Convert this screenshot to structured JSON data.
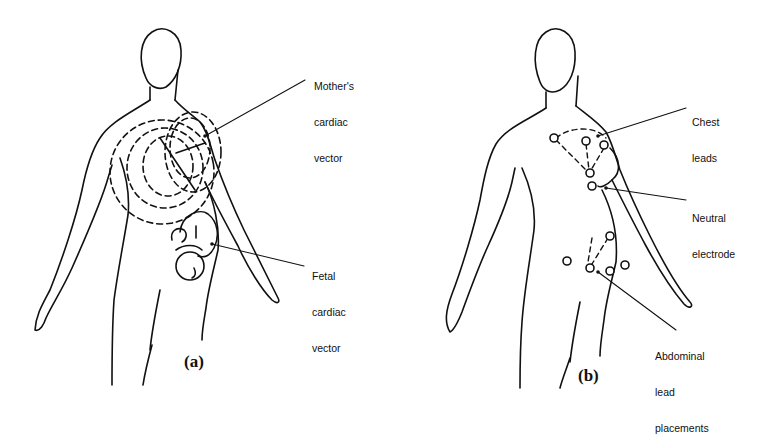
{
  "colors": {
    "ink": "#111111",
    "background": "#ffffff"
  },
  "panels": [
    {
      "id": "a",
      "label": "(a)",
      "annotations": [
        {
          "line1": "Mother's",
          "line2": "cardiac",
          "line3": "vector"
        },
        {
          "line1": "Fetal",
          "line2": "cardiac",
          "line3": "vector"
        }
      ]
    },
    {
      "id": "b",
      "label": "(b)",
      "annotations": [
        {
          "line1": "Chest",
          "line2": "leads"
        },
        {
          "line1": "Neutral",
          "line2": "electrode"
        },
        {
          "line1": "Abdominal",
          "line2": "lead",
          "line3": "placements"
        }
      ]
    }
  ]
}
